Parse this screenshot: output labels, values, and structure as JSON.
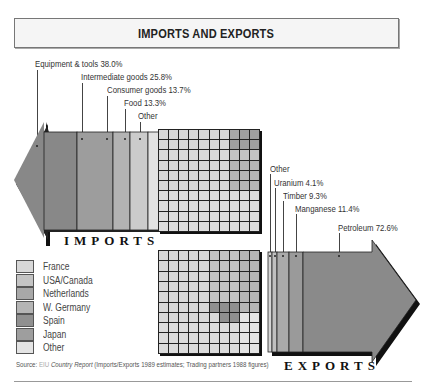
{
  "title": "IMPORTS AND EXPORTS",
  "imports": {
    "word": "IMPORTS",
    "segments": [
      {
        "label": "Equipment & tools 38.0%",
        "name": "Equipment & tools",
        "value": 38.0,
        "color": "#8a8a8a"
      },
      {
        "label": "Intermediate goods 25.8%",
        "name": "Intermediate goods",
        "value": 25.8,
        "color": "#9d9d9d"
      },
      {
        "label": "Consumer goods 13.7%",
        "name": "Consumer goods",
        "value": 13.7,
        "color": "#b3b3b3"
      },
      {
        "label": "Food 13.3%",
        "name": "Food",
        "value": 13.3,
        "color": "#cbcbcb"
      },
      {
        "label": "Other",
        "name": "Other",
        "value": 9.2,
        "color": "#e2e2e2"
      }
    ]
  },
  "exports": {
    "word": "EXPORTS",
    "segments": [
      {
        "label": "Other",
        "name": "Other",
        "value": 2.6,
        "color": "#d5d5d5"
      },
      {
        "label": "Uranium 4.1%",
        "name": "Uranium",
        "value": 4.1,
        "color": "#c0c0c0"
      },
      {
        "label": "Timber 9.3%",
        "name": "Timber",
        "value": 9.3,
        "color": "#aaaaaa"
      },
      {
        "label": "Manganese 11.4%",
        "name": "Manganese",
        "value": 11.4,
        "color": "#9a9a9a"
      },
      {
        "label": "Petroleum 72.6%",
        "name": "Petroleum",
        "value": 72.6,
        "color": "#8a8a8a"
      }
    ]
  },
  "legend": [
    {
      "label": "France",
      "color": "#d8d8d8"
    },
    {
      "label": "USA/Canada",
      "color": "#c4c4c4"
    },
    {
      "label": "Netherlands",
      "color": "#a8a8a8"
    },
    {
      "label": "W. Germany",
      "color": "#b5b5b5"
    },
    {
      "label": "Spain",
      "color": "#909090"
    },
    {
      "label": "Japan",
      "color": "#9e9e9e"
    },
    {
      "label": "Other",
      "color": "#e4e4e4"
    }
  ],
  "source": {
    "prefix": "Source:",
    "publisher": "EIU",
    "report": "Country Report",
    "note": "(Imports/Exports 1989 estimates; Trading partners 1988 figures)"
  },
  "chart_data": [
    {
      "type": "bar",
      "title": "Imports",
      "categories": [
        "Equipment & tools",
        "Intermediate goods",
        "Consumer goods",
        "Food",
        "Other"
      ],
      "values": [
        38.0,
        25.8,
        13.7,
        13.3,
        9.2
      ],
      "unit": "%"
    },
    {
      "type": "bar",
      "title": "Exports",
      "categories": [
        "Petroleum",
        "Manganese",
        "Timber",
        "Uranium",
        "Other"
      ],
      "values": [
        72.6,
        11.4,
        9.3,
        4.1,
        2.6
      ],
      "unit": "%"
    },
    {
      "type": "heatmap",
      "title": "Import trading partners (10x10 waffle)",
      "legend": [
        "France",
        "USA/Canada",
        "Netherlands",
        "W. Germany",
        "Spain",
        "Japan",
        "Other"
      ]
    },
    {
      "type": "heatmap",
      "title": "Export trading partners (10x10 waffle)",
      "legend": [
        "France",
        "USA/Canada",
        "Netherlands",
        "W. Germany",
        "Spain",
        "Japan",
        "Other"
      ]
    }
  ]
}
